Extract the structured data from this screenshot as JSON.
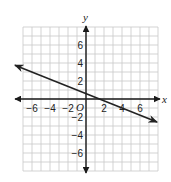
{
  "chart_data": {
    "type": "line",
    "title": "",
    "xlabel": "x",
    "ylabel": "y",
    "origin_label": "O",
    "xlim": [
      -7.5,
      8
    ],
    "ylim": [
      -8,
      7.5
    ],
    "grid": true,
    "grid_step": 1,
    "x_tick_labels": [
      {
        "value": -6,
        "label": "−6"
      },
      {
        "value": -4,
        "label": "−4"
      },
      {
        "value": -2,
        "label": "−2"
      },
      {
        "value": 2,
        "label": "2"
      },
      {
        "value": 4,
        "label": "4"
      },
      {
        "value": 6,
        "label": "6"
      }
    ],
    "y_tick_labels": [
      {
        "value": 6,
        "label": "6"
      },
      {
        "value": 4,
        "label": "4"
      },
      {
        "value": 2,
        "label": "2"
      },
      {
        "value": -2,
        "label": "−2"
      },
      {
        "value": -4,
        "label": "−4"
      },
      {
        "value": -6,
        "label": "−6"
      }
    ],
    "series": [
      {
        "name": "line",
        "equation": "y = -0.4x + 0.6",
        "slope": -0.4,
        "intercept": 0.6,
        "x": [
          -7.9,
          7.9
        ],
        "y": [
          3.76,
          -2.56
        ],
        "arrows": "both",
        "color": "#222222"
      }
    ],
    "colors": {
      "grid": "#c8c8c8",
      "axis": "#1a1a1a",
      "line": "#222222"
    }
  },
  "layout": {
    "origin_px": [
      86,
      99
    ],
    "unit_px": 9,
    "grid_x_range": [
      -7,
      8
    ],
    "grid_y_range": [
      -8,
      8
    ]
  }
}
